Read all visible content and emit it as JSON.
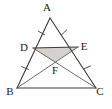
{
  "figure": {
    "background_color": "#ffffff",
    "line_color": "#3a3a3a",
    "cevian_color": "#55555a",
    "shade_color": "#d5d1cd",
    "label_color": "#1a1a1a"
  },
  "points": {
    "A": {
      "label": "A",
      "x": 50,
      "y": 18,
      "label_x": 47,
      "label_y": 11
    },
    "B": {
      "label": "B",
      "x": 17,
      "y": 88,
      "label_x": 10,
      "label_y": 95
    },
    "C": {
      "label": "C",
      "x": 96,
      "y": 88,
      "label_x": 100,
      "label_y": 95
    },
    "D": {
      "label": "D",
      "x": 33,
      "y": 48,
      "label_x": 24,
      "label_y": 51
    },
    "E": {
      "label": "E",
      "x": 78,
      "y": 47,
      "label_x": 84,
      "label_y": 50
    },
    "F": {
      "label": "F",
      "x": 55,
      "y": 62,
      "label_x": 55,
      "label_y": 74
    }
  },
  "segments": [
    {
      "name": "AB",
      "from": "A",
      "to": "B",
      "style": "edge"
    },
    {
      "name": "AC",
      "from": "A",
      "to": "C",
      "style": "edge"
    },
    {
      "name": "BC",
      "from": "B",
      "to": "C",
      "style": "edge"
    },
    {
      "name": "DE",
      "from": "D",
      "to": "E",
      "style": "midsegment"
    },
    {
      "name": "DC",
      "from": "D",
      "to": "C",
      "style": "cevian"
    },
    {
      "name": "EB",
      "from": "E",
      "to": "B",
      "style": "cevian"
    }
  ],
  "tick_marks": [
    {
      "name": "tick-AD",
      "on_segment": "AD",
      "count": 1
    },
    {
      "name": "tick-DB",
      "on_segment": "DB",
      "count": 1
    },
    {
      "name": "tick-AE",
      "on_segment": "AE",
      "count": 1
    },
    {
      "name": "tick-EC",
      "on_segment": "EC",
      "count": 1
    }
  ],
  "shaded_regions": [
    {
      "name": "triangle-DEF",
      "vertices": [
        "D",
        "E",
        "F"
      ],
      "color": "#d5d1cd"
    }
  ]
}
